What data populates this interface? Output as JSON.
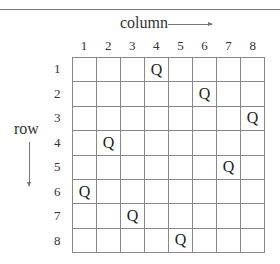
{
  "diagram": {
    "column_title": "column",
    "row_title": "row",
    "column_labels": [
      "1",
      "2",
      "3",
      "4",
      "5",
      "6",
      "7",
      "8"
    ],
    "row_labels": [
      "1",
      "2",
      "3",
      "4",
      "5",
      "6",
      "7",
      "8"
    ],
    "queen_symbol": "Q",
    "queens": [
      {
        "row": 1,
        "col": 4
      },
      {
        "row": 2,
        "col": 6
      },
      {
        "row": 3,
        "col": 8
      },
      {
        "row": 4,
        "col": 2
      },
      {
        "row": 5,
        "col": 7
      },
      {
        "row": 6,
        "col": 1
      },
      {
        "row": 7,
        "col": 3
      },
      {
        "row": 8,
        "col": 5
      }
    ]
  }
}
